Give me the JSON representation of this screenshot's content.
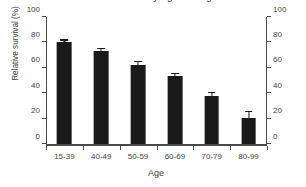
{
  "chart_data": {
    "type": "bar",
    "title": "Relative survival by age at diagnosis",
    "xlabel": "Age",
    "ylabel": "Relative survival (%)",
    "categories": [
      "15-39",
      "40-49",
      "50-59",
      "60-69",
      "70-79",
      "80-99"
    ],
    "values": [
      80.5,
      73.5,
      62.5,
      53.5,
      38.0,
      21.0
    ],
    "errors": [
      1.0,
      1.5,
      2.0,
      1.8,
      2.2,
      4.5
    ],
    "ylim": [
      0,
      100
    ],
    "yticks": [
      0,
      20,
      40,
      60,
      80,
      100
    ],
    "ytick_labels": [
      "0",
      "20",
      "40",
      "60",
      "80",
      "100"
    ],
    "y_axis_right": {
      "ylim": [
        0,
        100
      ],
      "yticks": [
        0,
        20,
        40,
        60,
        80,
        100
      ],
      "ytick_labels": [
        "0",
        "20",
        "40",
        "60",
        "80",
        "100"
      ]
    },
    "grid": false,
    "legend": null,
    "bar_color": "#1a1a1a",
    "axis_color": "#4a4a4a",
    "background": "#ffffff"
  }
}
